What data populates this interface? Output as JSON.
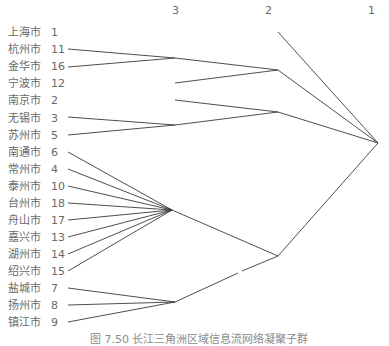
{
  "axis": {
    "levels": [
      {
        "label": "3",
        "x": 175
      },
      {
        "label": "2",
        "x": 268
      },
      {
        "label": "1",
        "x": 371
      }
    ]
  },
  "leaves": [
    {
      "name": "上海市",
      "id": "1"
    },
    {
      "name": "杭州市",
      "id": "11"
    },
    {
      "name": "金华市",
      "id": "16"
    },
    {
      "name": "宁波市",
      "id": "12"
    },
    {
      "name": "南京市",
      "id": "2"
    },
    {
      "name": "无锡市",
      "id": "3"
    },
    {
      "name": "苏州市",
      "id": "5"
    },
    {
      "name": "南通市",
      "id": "6"
    },
    {
      "name": "常州市",
      "id": "4"
    },
    {
      "name": "泰州市",
      "id": "10"
    },
    {
      "name": "台州市",
      "id": "18"
    },
    {
      "name": "舟山市",
      "id": "17"
    },
    {
      "name": "嘉兴市",
      "id": "13"
    },
    {
      "name": "湖州市",
      "id": "14"
    },
    {
      "name": "绍兴市",
      "id": "15"
    },
    {
      "name": "盐城市",
      "id": "7"
    },
    {
      "name": "扬州市",
      "id": "8"
    },
    {
      "name": "镇江市",
      "id": "9"
    }
  ],
  "clusters": {
    "level3": [
      {
        "members": [
          "杭州市",
          "金华市"
        ]
      },
      {
        "members": [
          "无锡市",
          "苏州市"
        ]
      },
      {
        "members": [
          "南通市",
          "常州市",
          "泰州市",
          "台州市",
          "舟山市",
          "嘉兴市",
          "湖州市",
          "绍兴市"
        ]
      },
      {
        "members": [
          "盐城市",
          "扬州市",
          "镇江市"
        ]
      }
    ],
    "level2": [
      {
        "members": [
          "杭州市",
          "金华市",
          "宁波市"
        ]
      },
      {
        "members": [
          "南京市",
          "无锡市",
          "苏州市"
        ]
      },
      {
        "members": [
          "南通市",
          "常州市",
          "泰州市",
          "台州市",
          "舟山市",
          "嘉兴市",
          "湖州市",
          "绍兴市",
          "盐城市",
          "扬州市",
          "镇江市"
        ]
      }
    ],
    "level1": [
      {
        "members": [
          "all"
        ]
      }
    ]
  },
  "caption": "图 7.50  长江三角洲区域信息流网络凝聚子群",
  "colors": {
    "line": "#3a3a3a",
    "text": "#6a6a6a"
  }
}
